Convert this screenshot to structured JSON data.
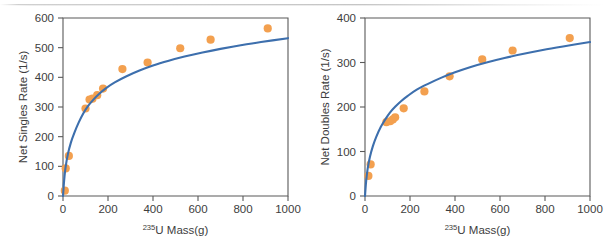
{
  "figure": {
    "panel_count": 2,
    "background_color": "#ffffff",
    "series_marker_color": "#F3A04F",
    "fit_line_color": "#3D6FAD",
    "axis_color": "#595959"
  },
  "chart_data": [
    {
      "panel": "left",
      "type": "scatter",
      "title": "",
      "xlabel": "235U Mass(g)",
      "xlabel_superscript": "235",
      "xlabel_base": "U  Mass(g)",
      "ylabel": "Net Singles Rate (1/s)",
      "xlim": [
        0,
        1000
      ],
      "ylim": [
        0,
        600
      ],
      "xticks": [
        0,
        200,
        400,
        600,
        800,
        1000
      ],
      "yticks": [
        0,
        100,
        200,
        300,
        400,
        500,
        600
      ],
      "grid": false,
      "legend": null,
      "series": [
        {
          "name": "Measured net singles rate",
          "kind": "scatter",
          "marker": "circle",
          "color": "#F3A04F",
          "points": [
            {
              "x": 8,
              "y": 18
            },
            {
              "x": 12,
              "y": 93
            },
            {
              "x": 26,
              "y": 135
            },
            {
              "x": 100,
              "y": 295
            },
            {
              "x": 118,
              "y": 325
            },
            {
              "x": 131,
              "y": 328
            },
            {
              "x": 152,
              "y": 340
            },
            {
              "x": 178,
              "y": 362
            },
            {
              "x": 264,
              "y": 428
            },
            {
              "x": 376,
              "y": 450
            },
            {
              "x": 521,
              "y": 498
            },
            {
              "x": 656,
              "y": 527
            },
            {
              "x": 910,
              "y": 565
            }
          ]
        },
        {
          "name": "Fit curve",
          "kind": "line",
          "color": "#3D6FAD",
          "model": "saturating-power",
          "description": "Monotonic concave fit rising steeply from origin then flattening toward ~565 at 1000 g",
          "points": [
            {
              "x": 0,
              "y": 0
            },
            {
              "x": 5,
              "y": 52
            },
            {
              "x": 12,
              "y": 100
            },
            {
              "x": 22,
              "y": 142
            },
            {
              "x": 35,
              "y": 180
            },
            {
              "x": 50,
              "y": 212
            },
            {
              "x": 70,
              "y": 248
            },
            {
              "x": 90,
              "y": 278
            },
            {
              "x": 110,
              "y": 302
            },
            {
              "x": 135,
              "y": 325
            },
            {
              "x": 160,
              "y": 344
            },
            {
              "x": 190,
              "y": 363
            },
            {
              "x": 230,
              "y": 383
            },
            {
              "x": 280,
              "y": 403
            },
            {
              "x": 340,
              "y": 423
            },
            {
              "x": 400,
              "y": 440
            },
            {
              "x": 470,
              "y": 456
            },
            {
              "x": 540,
              "y": 470
            },
            {
              "x": 620,
              "y": 484
            },
            {
              "x": 700,
              "y": 496
            },
            {
              "x": 790,
              "y": 508
            },
            {
              "x": 880,
              "y": 519
            },
            {
              "x": 1000,
              "y": 532
            }
          ]
        }
      ]
    },
    {
      "panel": "right",
      "type": "scatter",
      "title": "",
      "xlabel": "235U Mass(g)",
      "xlabel_superscript": "235",
      "xlabel_base": "U  Mass(g)",
      "ylabel": "Net Doubles Rate (1/s)",
      "xlim": [
        0,
        1000
      ],
      "ylim": [
        0,
        400
      ],
      "xticks": [
        0,
        200,
        400,
        600,
        800,
        1000
      ],
      "yticks": [
        0,
        100,
        200,
        300,
        400
      ],
      "grid": false,
      "legend": null,
      "series": [
        {
          "name": "Measured net doubles rate",
          "kind": "scatter",
          "marker": "circle",
          "color": "#F3A04F",
          "points": [
            {
              "x": 15,
              "y": 45
            },
            {
              "x": 25,
              "y": 71
            },
            {
              "x": 95,
              "y": 166
            },
            {
              "x": 112,
              "y": 168
            },
            {
              "x": 124,
              "y": 172
            },
            {
              "x": 134,
              "y": 177
            },
            {
              "x": 172,
              "y": 197
            },
            {
              "x": 264,
              "y": 235
            },
            {
              "x": 376,
              "y": 269
            },
            {
              "x": 521,
              "y": 307
            },
            {
              "x": 656,
              "y": 327
            },
            {
              "x": 910,
              "y": 355
            }
          ]
        },
        {
          "name": "Fit curve",
          "kind": "line",
          "color": "#3D6FAD",
          "model": "saturating-power",
          "description": "Monotonic concave fit rising steeply from origin then flattening toward ~350 at 1000 g",
          "points": [
            {
              "x": 0,
              "y": 0
            },
            {
              "x": 5,
              "y": 33
            },
            {
              "x": 12,
              "y": 62
            },
            {
              "x": 22,
              "y": 88
            },
            {
              "x": 35,
              "y": 112
            },
            {
              "x": 50,
              "y": 133
            },
            {
              "x": 70,
              "y": 155
            },
            {
              "x": 90,
              "y": 172
            },
            {
              "x": 110,
              "y": 187
            },
            {
              "x": 135,
              "y": 201
            },
            {
              "x": 160,
              "y": 213
            },
            {
              "x": 190,
              "y": 225
            },
            {
              "x": 230,
              "y": 239
            },
            {
              "x": 280,
              "y": 252
            },
            {
              "x": 340,
              "y": 266
            },
            {
              "x": 400,
              "y": 278
            },
            {
              "x": 470,
              "y": 290
            },
            {
              "x": 540,
              "y": 300
            },
            {
              "x": 620,
              "y": 310
            },
            {
              "x": 700,
              "y": 319
            },
            {
              "x": 790,
              "y": 328
            },
            {
              "x": 880,
              "y": 336
            },
            {
              "x": 1000,
              "y": 346
            }
          ]
        }
      ]
    }
  ]
}
